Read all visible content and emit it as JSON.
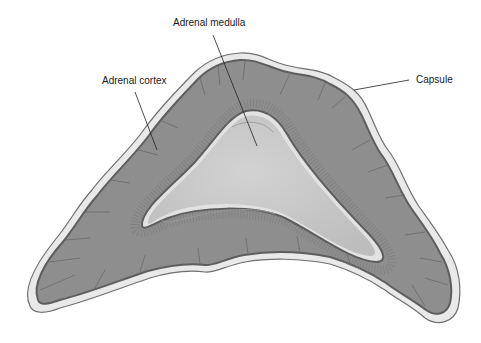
{
  "figure": {
    "type": "anatomical cross-section"
  },
  "labels": {
    "medulla": "Adrenal medulla",
    "cortex": "Adrenal cortex",
    "capsule": "Capsule"
  },
  "colors": {
    "background": "#ffffff",
    "capsule_fill": "#e9e9e9",
    "capsule_edge": "#6f6f6f",
    "cortex_fill": "#8e8e8e",
    "cortex_dark_edge": "#5e5e5e",
    "medulla_fill": "#c9c9c9",
    "medulla_rim": "#e2e2e2",
    "leader_line": "#222222",
    "text": "#1a1a1a"
  }
}
